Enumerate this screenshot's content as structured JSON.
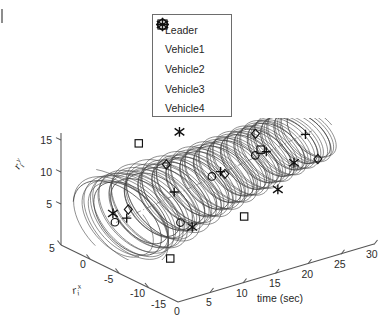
{
  "legend": {
    "entries": [
      {
        "label": "Leader",
        "marker": "plus-marker"
      },
      {
        "label": "Vehicle1",
        "marker": "asterisk-marker"
      },
      {
        "label": "Vehicle2",
        "marker": "circle-marker"
      },
      {
        "label": "Vehicle3",
        "marker": "square-marker"
      },
      {
        "label": "Vehicle4",
        "marker": "diamond-marker"
      }
    ]
  },
  "axes": {
    "vertical": {
      "label": "r",
      "label_sub": "i",
      "label_sup": "y",
      "ticks": [
        "5",
        "10",
        "15"
      ]
    },
    "depth": {
      "label": "r",
      "label_sub": "i",
      "label_sup": "x",
      "ticks": [
        "5",
        "0",
        "-5",
        "-10",
        "-15"
      ]
    },
    "horizontal": {
      "label": "time (sec)",
      "ticks": [
        "0",
        "5",
        "10",
        "15",
        "20",
        "25",
        "30"
      ]
    }
  },
  "chart_data": {
    "type": "line",
    "title": "",
    "xlabel": "time (sec)",
    "ylabel": "r_i^y",
    "zlabel": "r_i^x",
    "projection": "3d",
    "grid": false,
    "legend_position": "top-center",
    "xlim": [
      0,
      30
    ],
    "ylim": [
      3,
      16
    ],
    "zlim": [
      -15,
      5
    ],
    "xticks": [
      0,
      5,
      10,
      15,
      20,
      25,
      30
    ],
    "yticks": [
      5,
      10,
      15
    ],
    "zticks": [
      5,
      0,
      -5,
      -10,
      -15
    ],
    "series": [
      {
        "name": "Leader",
        "marker": "plus",
        "marker_points": [
          {
            "time": 2.0,
            "rx": -4.0,
            "ry": 6.2
          },
          {
            "time": 9.0,
            "rx": -4.3,
            "ry": 8.3
          },
          {
            "time": 16.0,
            "rx": -4.4,
            "ry": 9.4
          },
          {
            "time": 23.0,
            "rx": -4.4,
            "ry": 10.4
          },
          {
            "time": 29.0,
            "rx": -4.4,
            "ry": 11.3
          }
        ],
        "spiral": {
          "radius_start": 5.2,
          "radius_end": 3.4,
          "turns": 15,
          "phase": 0.0
        }
      },
      {
        "name": "Vehicle1",
        "marker": "asterisk",
        "marker_points": [
          {
            "time": 0.6,
            "rx": -3.2,
            "ry": 7.0
          },
          {
            "time": 8.0,
            "rx": -8.5,
            "ry": 5.0
          },
          {
            "time": 15.0,
            "rx": 1.5,
            "ry": 13.3
          },
          {
            "time": 22.0,
            "rx": -7.5,
            "ry": 6.2
          },
          {
            "time": 28.5,
            "rx": -3.0,
            "ry": 6.4
          }
        ],
        "spiral": {
          "radius_start": 6.4,
          "radius_end": 3.6,
          "turns": 15,
          "phase": 2.4
        }
      },
      {
        "name": "Vehicle2",
        "marker": "circle",
        "marker_points": [
          {
            "time": 0.2,
            "rx": -4.0,
            "ry": 6.1
          },
          {
            "time": 7.0,
            "rx": -7.6,
            "ry": 5.6
          },
          {
            "time": 14.5,
            "rx": -4.6,
            "ry": 9.2
          },
          {
            "time": 21.5,
            "rx": -4.2,
            "ry": 10.2
          },
          {
            "time": 28.0,
            "rx": -1.0,
            "ry": 13.0
          }
        ],
        "spiral": {
          "radius_start": 6.0,
          "radius_end": 3.5,
          "turns": 15,
          "phase": 4.0
        }
      },
      {
        "name": "Vehicle3",
        "marker": "square",
        "marker_points": [
          {
            "time": 1.5,
            "rx": -12.0,
            "ry": 3.6
          },
          {
            "time": 8.5,
            "rx": 1.2,
            "ry": 13.6
          },
          {
            "time": 15.5,
            "rx": -9.0,
            "ry": 4.6
          },
          {
            "time": 22.5,
            "rx": -4.0,
            "ry": 10.7
          },
          {
            "time": 29.5,
            "rx": 0.6,
            "ry": 14.6
          }
        ],
        "spiral": {
          "radius_start": 7.2,
          "radius_end": 3.7,
          "turns": 15,
          "phase": 1.2
        }
      },
      {
        "name": "Vehicle4",
        "marker": "diamond",
        "marker_points": [
          {
            "time": 2.6,
            "rx": -3.6,
            "ry": 7.2
          },
          {
            "time": 9.5,
            "rx": -2.4,
            "ry": 11.6
          },
          {
            "time": 16.5,
            "rx": -4.6,
            "ry": 9.0
          },
          {
            "time": 23.5,
            "rx": -2.0,
            "ry": 12.0
          },
          {
            "time": 30.0,
            "rx": -5.4,
            "ry": 7.6
          }
        ],
        "spiral": {
          "radius_start": 5.8,
          "radius_end": 3.5,
          "turns": 15,
          "phase": 5.2
        }
      }
    ]
  }
}
